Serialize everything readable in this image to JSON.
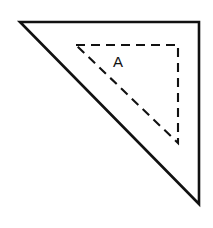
{
  "figure": {
    "background_color": "#ffffff",
    "stroke_color": "#111111",
    "canvas": {
      "width": 213,
      "height": 228
    },
    "outer_triangle": {
      "name": "solid-right-triangle",
      "style": "solid",
      "stroke_width": 2.6,
      "points": "20,22 199,22 199,204",
      "vertices": [
        {
          "id": "outer-top-left",
          "x": 20,
          "y": 22
        },
        {
          "id": "outer-top-right",
          "x": 199,
          "y": 22
        },
        {
          "id": "outer-bottom-right",
          "x": 199,
          "y": 204
        }
      ]
    },
    "inner_triangle": {
      "name": "dashed-right-triangle",
      "style": "dashed",
      "stroke_width": 2.1,
      "dash_pattern": "9 6",
      "points": "76,45 178,45 178,143",
      "vertices": [
        {
          "id": "inner-top-left",
          "x": 76,
          "y": 45
        },
        {
          "id": "inner-top-right",
          "x": 178,
          "y": 45
        },
        {
          "id": "inner-bottom-right",
          "x": 178,
          "y": 143
        }
      ]
    },
    "labels": [
      {
        "id": "label-a",
        "text": "A",
        "x": 118,
        "y": 63,
        "font_size": 15
      }
    ]
  }
}
